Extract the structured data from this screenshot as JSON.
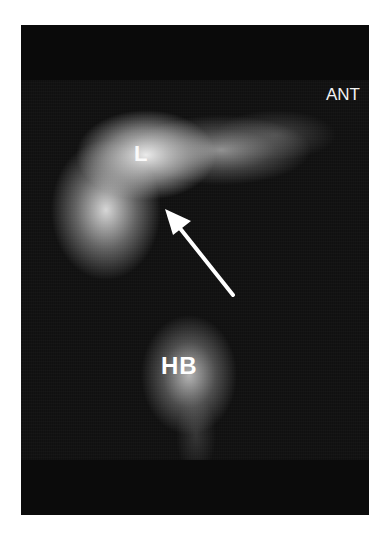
{
  "image": {
    "type": "nuclear-medicine-scintigram",
    "view_label": "ANT",
    "labels": {
      "liver": "L",
      "heart_blood_pool": "HB"
    },
    "annotation": {
      "shape": "arrow",
      "color": "#ffffff",
      "points_to": "inferior margin of liver"
    },
    "colors": {
      "background": "#ffffff",
      "scan_field": "#101010",
      "activity": "#f0f0f0"
    }
  }
}
